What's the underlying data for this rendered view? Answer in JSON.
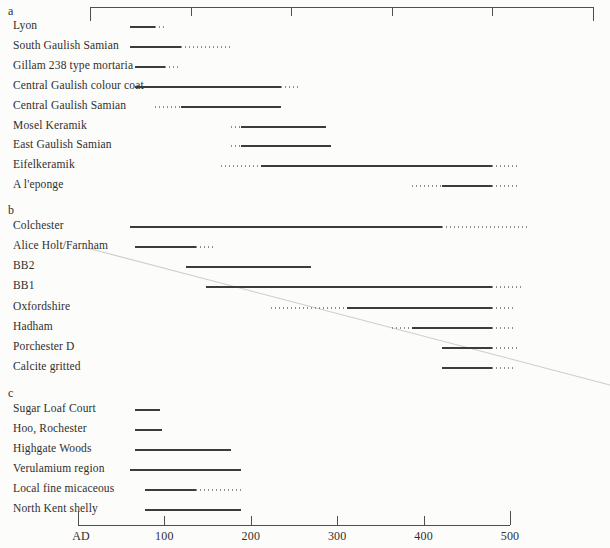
{
  "colors": {
    "ink": "#3c3c3c",
    "dot": "#8f8f8f",
    "axis": "#4f4f4f",
    "text": "#2f2f2f",
    "crease": "#cdccc7",
    "paper": "#fcfcfa"
  },
  "chart_data": {
    "type": "bar",
    "subtype": "horizontal-date-range-timeline",
    "x_axis": {
      "unit": "years AD",
      "min": 0,
      "max": 500,
      "tick_interval": 100,
      "bottom_tick_labels": [
        "AD",
        "100",
        "200",
        "300",
        "400",
        "500"
      ],
      "top_axis_has_labels": false
    },
    "sections": [
      {
        "label": "a",
        "rows": [
          {
            "label": "Lyon",
            "solid": [
              40,
              65
            ],
            "dotted_after": 75
          },
          {
            "label": "South Gaulish Samian",
            "solid": [
              40,
              90
            ],
            "dotted_after": 140
          },
          {
            "label": "Gillam 238 type mortaria",
            "solid": [
              45,
              75
            ],
            "dotted_after": 90
          },
          {
            "label": "Central Gaulish colour coat",
            "solid": [
              45,
              190
            ],
            "dotted_after": 210
          },
          {
            "label": "Central Gaulish Samian",
            "dotted_before": 65,
            "solid": [
              90,
              190
            ]
          },
          {
            "label": "Mosel Keramik",
            "dotted_before": 140,
            "solid": [
              150,
              235
            ]
          },
          {
            "label": "East Gaulish Samian",
            "dotted_before": 140,
            "solid": [
              150,
              240
            ]
          },
          {
            "label": "Eifelkeramik",
            "dotted_before": 130,
            "solid": [
              170,
              400
            ],
            "dotted_after": 425
          },
          {
            "label": "A l'eponge",
            "dotted_before": 320,
            "solid": [
              350,
              400
            ],
            "dotted_after": 425
          }
        ]
      },
      {
        "label": "b",
        "rows": [
          {
            "label": "Colchester",
            "solid": [
              40,
              350
            ],
            "dotted_after": 435
          },
          {
            "label": "Alice Holt/Farnham",
            "solid": [
              45,
              105
            ],
            "dotted_after": 125
          },
          {
            "label": "BB2",
            "solid": [
              95,
              220
            ]
          },
          {
            "label": "BB1",
            "solid": [
              115,
              400
            ],
            "dotted_after": 430
          },
          {
            "label": "Oxfordshire",
            "dotted_before": 180,
            "solid": [
              255,
              400
            ],
            "dotted_after": 420
          },
          {
            "label": "Hadham",
            "dotted_before": 300,
            "solid": [
              320,
              400
            ],
            "dotted_after": 420
          },
          {
            "label": "Porchester D",
            "solid": [
              350,
              400
            ],
            "dotted_after": 425
          },
          {
            "label": "Calcite gritted",
            "solid": [
              350,
              400
            ],
            "dotted_after": 420
          }
        ]
      },
      {
        "label": "c",
        "rows": [
          {
            "label": "Sugar Loaf Court",
            "solid": [
              45,
              70
            ]
          },
          {
            "label": "Hoo, Rochester",
            "solid": [
              45,
              72
            ]
          },
          {
            "label": "Highgate Woods",
            "solid": [
              45,
              140
            ]
          },
          {
            "label": "Verulamium region",
            "solid": [
              40,
              150
            ]
          },
          {
            "label": "Local fine micaceous",
            "solid": [
              55,
              105
            ],
            "dotted_after": 150
          },
          {
            "label": "North Kent shelly",
            "solid": [
              55,
              150
            ]
          }
        ]
      }
    ]
  }
}
